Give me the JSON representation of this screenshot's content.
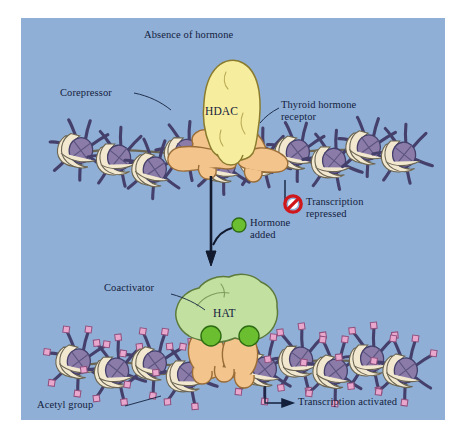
{
  "figure": {
    "background_color": "#8FAFD6",
    "text_color": "#14213d",
    "frame_color": "#ffffff"
  },
  "panels": {
    "top": {
      "heading": "Absence of hormone",
      "labels": {
        "corepressor": "Corepressor",
        "enzyme": "HDAC",
        "receptor": "Thyroid hormone\nreceptor",
        "receptor_line1": "Thyroid hormone",
        "receptor_line2": "receptor"
      },
      "status": {
        "icon": "prohibition-icon",
        "line1": "Transcription",
        "line2": "repressed",
        "icon_color": "#D0181C"
      }
    },
    "transition": {
      "arrow": "down-arrow",
      "hormone_marker": "green-circle",
      "hormone_color": "#6ABE30",
      "line1": "Hormone",
      "line2": "added"
    },
    "bottom": {
      "labels": {
        "coactivator": "Coactivator",
        "enzyme": "HAT",
        "acetyl": "Acetyl group"
      },
      "status": {
        "icon": "right-arrow-icon",
        "text": "Transcription activated"
      }
    }
  },
  "colors": {
    "hdac": "#F7ED9E",
    "hdac_stroke": "#8a7b2e",
    "hat": "#C2E0A0",
    "hat_stroke": "#5d7a3c",
    "receptor": "#F3C58D",
    "receptor_stroke": "#9a6d38",
    "histone_core": "#8B7BA8",
    "histone_stroke": "#44406b",
    "dna": "#F2E8D0",
    "dna_stroke": "#6b6552",
    "acetyl": "#E9A7CE",
    "acetyl_stroke": "#8f4f7c",
    "hormone": "#6ABE30",
    "hormone_stroke": "#2d6b12",
    "arrow": "#111a2e",
    "prohibition": "#D0181C"
  },
  "legend_items": [
    {
      "name": "hdac-complex",
      "label": "HDAC"
    },
    {
      "name": "hat-complex",
      "label": "HAT"
    },
    {
      "name": "thyroid-hormone-receptor",
      "label": "Thyroid hormone receptor"
    },
    {
      "name": "acetyl-group",
      "label": "Acetyl group"
    },
    {
      "name": "hormone",
      "label": "Hormone added"
    }
  ]
}
